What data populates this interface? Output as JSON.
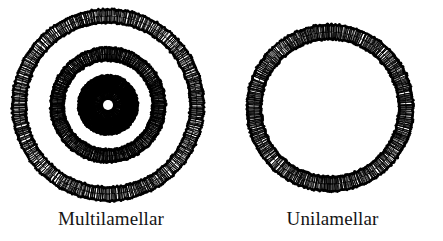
{
  "figure": {
    "background_color": "#ffffff",
    "ink_color": "#000000",
    "width": 443,
    "height": 241
  },
  "panels": [
    {
      "id": "multilamellar",
      "caption": "Multilamellar",
      "description": "Concentric lipid bilayer shells enclosing multiple aqueous compartments",
      "center": {
        "x": 108,
        "y": 105
      },
      "bilayers": [
        {
          "name": "outer-bilayer",
          "radius": 89,
          "thickness": 15
        },
        {
          "name": "middle-bilayer",
          "radius": 51,
          "thickness": 14
        },
        {
          "name": "inner-bilayer",
          "radius": 22,
          "thickness": 16
        }
      ],
      "aqueous_core_radius": 5,
      "lamellae_count": 3
    },
    {
      "id": "unilamellar",
      "caption": "Unilamellar",
      "description": "Single lipid bilayer shell enclosing one large aqueous core",
      "center": {
        "x": 330,
        "y": 108
      },
      "bilayers": [
        {
          "name": "single-bilayer",
          "radius": 76,
          "thickness": 16
        }
      ],
      "aqueous_core_radius": 68,
      "lamellae_count": 1
    }
  ],
  "rendering": {
    "head_spacing_deg": 1.35,
    "tail_density": 3,
    "jitter": 0.9
  }
}
